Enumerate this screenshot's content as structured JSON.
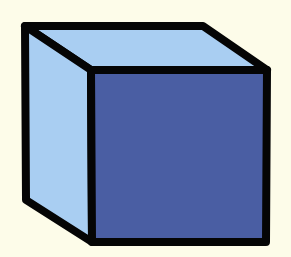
{
  "image": {
    "subject": "cube",
    "description": "Cube illustration with a light blue top and left side and a dark blue front face, outlined in thick black",
    "width": 291,
    "height": 257
  },
  "colors": {
    "background": "#fdfce9",
    "light_face": "#a9cef2",
    "front_face": "#4a5ea3",
    "outline": "#050505"
  },
  "geometry": {
    "stroke_width": 8,
    "top_face": "25,26 203,26 267,70 91,70",
    "left_face": "25,26 91,70 92,242 26,200",
    "front_face": "91,70 267,70 266,242 92,242"
  }
}
